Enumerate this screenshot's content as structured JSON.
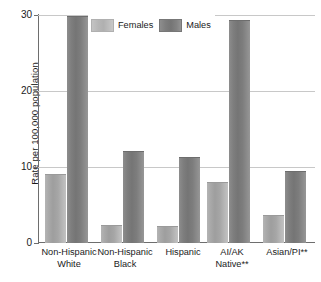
{
  "chart_data": {
    "type": "bar",
    "title": "",
    "xlabel": "",
    "ylabel": "Rate per 100,000 population",
    "ylim": [
      0,
      30
    ],
    "yticks": [
      0,
      10,
      20,
      30
    ],
    "ytick_labels": [
      "0",
      "10",
      "20",
      "30"
    ],
    "grid": true,
    "legend_position": "top-center",
    "categories": [
      "Non-Hispanic White",
      "Non-Hispanic Black",
      "Hispanic",
      "AI/AK Native**",
      "Asian/PI**"
    ],
    "category_lines": [
      [
        "Non-Hispanic",
        "White"
      ],
      [
        "Non-Hispanic",
        "Black"
      ],
      [
        "Hispanic",
        ""
      ],
      [
        "AI/AK",
        "Native**"
      ],
      [
        "Asian/PI**",
        ""
      ]
    ],
    "series": [
      {
        "name": "Females",
        "color": "#ababab",
        "values": [
          8.9,
          2.2,
          2.1,
          7.9,
          3.6
        ]
      },
      {
        "name": "Males",
        "color": "#7b7b7b",
        "values": [
          29.8,
          12.0,
          11.2,
          29.2,
          9.4
        ]
      }
    ]
  },
  "legend": {
    "items": [
      {
        "label": "Females",
        "swatch": "females-swatch"
      },
      {
        "label": "Males",
        "swatch": "males-swatch"
      }
    ]
  },
  "axis": {
    "y_title": "Rate per 100,000 population",
    "y_ticks": [
      "30",
      "20",
      "10",
      "0"
    ]
  },
  "colors": {
    "females": "#ababab",
    "males": "#7b7b7b",
    "gridline": "#c8c8c8",
    "axis": "#6e6e6e",
    "text": "#1a1a1a",
    "background": "#ffffff"
  }
}
